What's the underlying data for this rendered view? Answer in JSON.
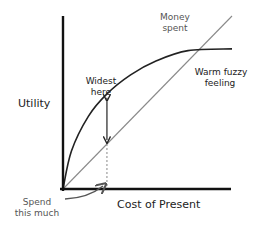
{
  "chart_data": {
    "type": "line",
    "title": "",
    "xlabel": "Cost of Present",
    "ylabel": "Utility",
    "grid": false,
    "series": [
      {
        "name": "Money spent",
        "style": "straight-line",
        "color": "#8a8a8a",
        "x": [
          0,
          1
        ],
        "y": [
          0,
          1
        ]
      },
      {
        "name": "Warm fuzzy feeling",
        "style": "concave-curve",
        "color": "#222222",
        "x": [
          0,
          0.05,
          0.15,
          0.26,
          0.4,
          0.55,
          0.74,
          1
        ],
        "y": [
          0,
          0.22,
          0.42,
          0.55,
          0.66,
          0.74,
          0.8,
          0.81
        ]
      }
    ],
    "annotations": [
      {
        "id": "widest",
        "text": [
          "Widest",
          "here"
        ],
        "type": "double-arrow",
        "x": 0.26
      },
      {
        "id": "spend",
        "text": [
          "Spend",
          "this much"
        ],
        "type": "curved-arrow",
        "x": 0.26
      },
      {
        "id": "money",
        "text": [
          "Money",
          "spent"
        ]
      },
      {
        "id": "fuzzy",
        "text": [
          "Warm fuzzy",
          "feeling"
        ]
      }
    ]
  },
  "labels": {
    "y_axis": "Utility",
    "x_axis": "Cost of Present",
    "money_line_1": "Money",
    "money_line_2": "spent",
    "fuzzy_line_1": "Warm fuzzy",
    "fuzzy_line_2": "feeling",
    "widest_line_1": "Widest",
    "widest_line_2": "here",
    "spend_line_1": "Spend",
    "spend_line_2": "this much"
  },
  "colors": {
    "axis": "#111111",
    "money_line": "#8a8a8a",
    "curve": "#222222",
    "annotation_text": "#555555"
  }
}
